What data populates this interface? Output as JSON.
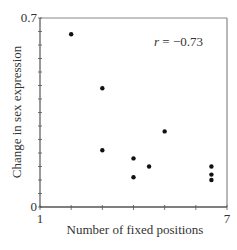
{
  "chart_data": {
    "type": "scatter",
    "title": "",
    "xlabel": "Number of fixed positions",
    "ylabel": "Change in sex expression",
    "xlim": [
      1,
      7
    ],
    "ylim": [
      0,
      0.7
    ],
    "x_tick_labels": [
      "1",
      "7"
    ],
    "y_tick_labels": [
      "0",
      "0.7"
    ],
    "x_minor_ticks": [
      1,
      2,
      3,
      4,
      5,
      6,
      7
    ],
    "y_minor_ticks": [
      0,
      0.05,
      0.1,
      0.15,
      0.2,
      0.25,
      0.3,
      0.35,
      0.4,
      0.45,
      0.5,
      0.55,
      0.6,
      0.65,
      0.7
    ],
    "grid": false,
    "legend": null,
    "annotation": "r = −0.73",
    "series": [
      {
        "name": "data",
        "marker": "circle",
        "color": "#111111",
        "points": [
          {
            "x": 2.0,
            "y": 0.64
          },
          {
            "x": 3.0,
            "y": 0.44
          },
          {
            "x": 3.0,
            "y": 0.21
          },
          {
            "x": 4.0,
            "y": 0.18
          },
          {
            "x": 4.0,
            "y": 0.11
          },
          {
            "x": 4.5,
            "y": 0.15
          },
          {
            "x": 5.0,
            "y": 0.28
          },
          {
            "x": 6.5,
            "y": 0.15
          },
          {
            "x": 6.5,
            "y": 0.12
          },
          {
            "x": 6.5,
            "y": 0.1
          }
        ]
      }
    ]
  },
  "colors": {
    "axis": "#555555",
    "frame": "#888888",
    "point": "#111111",
    "text": "#333333"
  }
}
